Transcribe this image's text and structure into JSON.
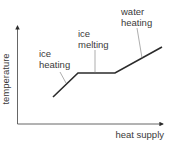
{
  "diagram": {
    "type": "heating-curve",
    "axes": {
      "x_label": "heat supply",
      "y_label": "temperature"
    },
    "segments": [
      {
        "name": "ice-heating",
        "label_line1": "ice",
        "label_line2": "heating"
      },
      {
        "name": "ice-melting",
        "label_line1": "ice",
        "label_line2": "melting"
      },
      {
        "name": "water-heating",
        "label_line1": "water",
        "label_line2": "heating"
      }
    ],
    "colors": {
      "curve": "#2b2b2b",
      "axes": "#555555",
      "leader": "#777777",
      "text": "#3a3a3a"
    }
  }
}
